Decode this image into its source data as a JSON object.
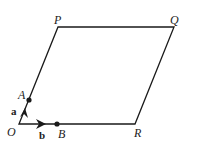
{
  "diagram": {
    "type": "parallelogram-vectors",
    "points": {
      "O": {
        "label": "O",
        "x": 19,
        "y": 124
      },
      "A": {
        "label": "A",
        "x": 29,
        "y": 100
      },
      "B": {
        "label": "B",
        "x": 57,
        "y": 124
      },
      "P": {
        "label": "P",
        "x": 58,
        "y": 27
      },
      "Q": {
        "label": "Q",
        "x": 174,
        "y": 27
      },
      "R": {
        "label": "R",
        "x": 135,
        "y": 124
      }
    },
    "vectors": {
      "a": {
        "label": "a",
        "from": "O",
        "to": "A"
      },
      "b": {
        "label": "b",
        "from": "O",
        "to": "B"
      }
    },
    "edges": [
      "O-P",
      "P-Q",
      "Q-R",
      "R-O"
    ],
    "stroke_color": "#1a1a1a"
  }
}
